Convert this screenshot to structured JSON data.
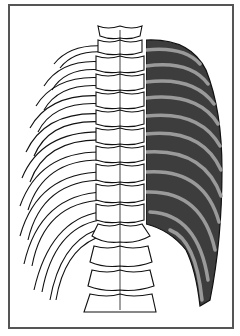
{
  "figure": {
    "caption": "",
    "regions": {
      "left": "bare ribs (outline)",
      "center": "vertebral column",
      "right": "intercostal muscles (shaded)"
    },
    "colors": {
      "frame": "#555555",
      "background": "#ffffff",
      "outline": "#111111",
      "muscle_dark": "#3d3d3d",
      "rib_band": "#9a9a9a"
    },
    "rib_count": 12,
    "vertebra_count": 17
  }
}
